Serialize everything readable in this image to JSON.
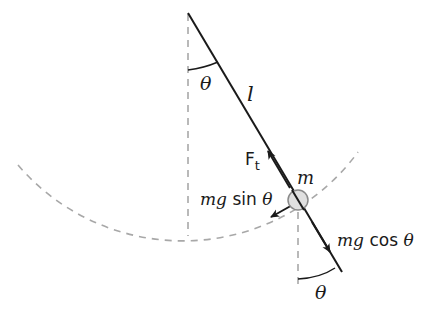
{
  "diagram": {
    "labels": {
      "theta_top": "θ",
      "length": "l",
      "tension": "F",
      "tension_sub": "t",
      "mass": "m",
      "mg_sin": "mg sin θ",
      "mg_cos": "mg cos θ",
      "theta_bottom": "θ"
    },
    "colors": {
      "line": "#1a1a1a",
      "dashed": "#a8a8a8",
      "bob_fill": "#e0e0e0",
      "bob_stroke": "#8a8a8a"
    },
    "geometry": {
      "pivot": [
        188,
        13
      ],
      "bob": [
        298,
        200
      ],
      "string_end": [
        342,
        272
      ],
      "arc_radius": 217
    }
  }
}
